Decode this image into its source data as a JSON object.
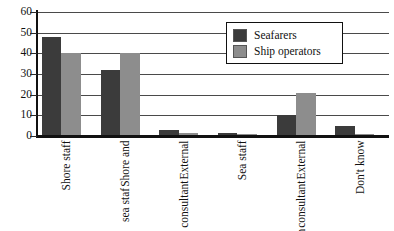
{
  "chart_data": {
    "type": "bar",
    "title": "",
    "xlabel": "",
    "ylabel": "",
    "ylim": [
      0,
      60
    ],
    "ytick_step": 10,
    "yticks": [
      0,
      10,
      20,
      30,
      40,
      50,
      60
    ],
    "grid": true,
    "legend_position": "top-right-inside",
    "categories": [
      "Shore staff",
      "Shore and sea staf",
      "External consultant",
      "Sea staff",
      "External consultant and own staff",
      "Don't know"
    ],
    "category_lines": [
      [
        "Shore staff"
      ],
      [
        "Shore and",
        "sea staf"
      ],
      [
        "External",
        "consultant"
      ],
      [
        "Sea staff"
      ],
      [
        "External",
        "consultant",
        "and own",
        "staff"
      ],
      [
        "Don't know"
      ]
    ],
    "series": [
      {
        "name": "Seafarers",
        "color": "#3b3b3b",
        "values": [
          48,
          32,
          3,
          1.5,
          10,
          5
        ]
      },
      {
        "name": "Ship operators",
        "color": "#8d8d8d",
        "values": [
          40,
          40,
          1.5,
          1,
          21,
          1
        ]
      }
    ]
  },
  "legend": {
    "items": [
      {
        "label": "Seafarers",
        "color": "#3b3b3b"
      },
      {
        "label": "Ship operators",
        "color": "#8d8d8d"
      }
    ]
  },
  "axis": {
    "y_tick_labels": [
      "60",
      "50",
      "40",
      "30",
      "20",
      "10",
      "0"
    ]
  }
}
